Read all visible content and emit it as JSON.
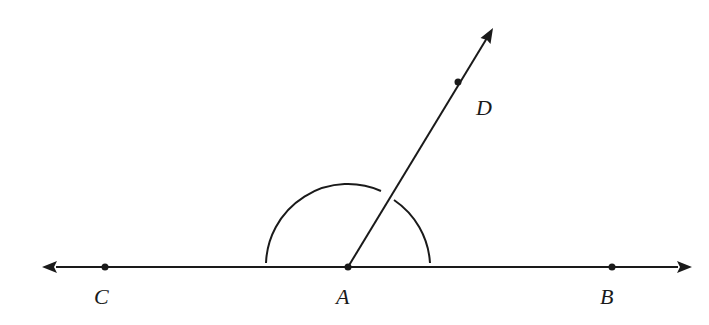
{
  "diagram": {
    "type": "geometry",
    "stroke_color": "#1a1a1a",
    "background": "#ffffff",
    "points": {
      "A": {
        "label": "A",
        "x": 348,
        "y": 267
      },
      "B": {
        "label": "B",
        "x": 612,
        "y": 267
      },
      "C": {
        "label": "C",
        "x": 105,
        "y": 267
      },
      "D": {
        "label": "D",
        "x": 458,
        "y": 82
      }
    },
    "line_CB": {
      "x1": 42,
      "y1": 267,
      "x2": 692,
      "y2": 267,
      "arrows": "both"
    },
    "ray_AD": {
      "x1": 348,
      "y1": 267,
      "x2": 493,
      "y2": 28,
      "arrows": "end"
    },
    "arc": {
      "center": "A",
      "radius": 82,
      "from_deg": 3,
      "to_deg": 177
    }
  }
}
